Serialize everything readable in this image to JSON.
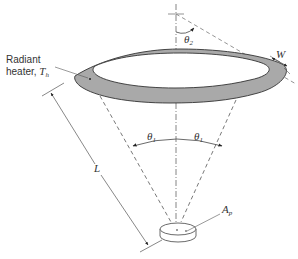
{
  "figure": {
    "labels": {
      "heater_line1": "Radiant",
      "heater_line2": "heater, ",
      "heater_temp": "T",
      "heater_temp_sub": "h",
      "width": "W",
      "length": "L",
      "theta2": "θ",
      "theta2_sub": "2",
      "theta1_left": "θ",
      "theta1_left_sub": "1",
      "theta1_right": "θ",
      "theta1_right_sub": "1",
      "area": "A",
      "area_sub": "p"
    },
    "colors": {
      "ring_fill": "#a9a9a9",
      "line": "#444444",
      "dashed": "#555555",
      "background": "#ffffff"
    },
    "components": [
      "radiant-heater-ring",
      "target-disk",
      "view-cone",
      "length-dimension",
      "width-dimension",
      "angle-theta1",
      "angle-theta2"
    ]
  }
}
